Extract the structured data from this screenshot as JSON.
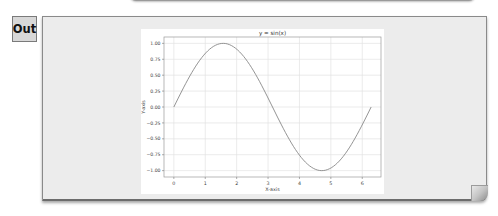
{
  "cell": {
    "out_label": "Out"
  },
  "chart_data": {
    "type": "line",
    "title": "y = sin(x)",
    "xlabel": "X-axis",
    "ylabel": "Y-axis",
    "xlim": [
      -0.314,
      6.597
    ],
    "ylim": [
      -1.1,
      1.1
    ],
    "xticks": [
      0,
      1,
      2,
      3,
      4,
      5,
      6
    ],
    "yticks": [
      1.0,
      0.75,
      0.5,
      0.25,
      0.0,
      -0.25,
      -0.5,
      -0.75,
      -1.0
    ],
    "xtick_labels": [
      "0",
      "1",
      "2",
      "3",
      "4",
      "5",
      "6"
    ],
    "ytick_labels": [
      "1.00",
      "0.75",
      "0.50",
      "0.25",
      "0.00",
      "−0.25",
      "−0.50",
      "−0.75",
      "−1.00"
    ],
    "grid": true,
    "legend": null,
    "series": [
      {
        "name": "sin(x)",
        "function": "sin",
        "x_range": [
          0,
          6.283
        ],
        "points": 100,
        "color": "#888888"
      }
    ]
  }
}
